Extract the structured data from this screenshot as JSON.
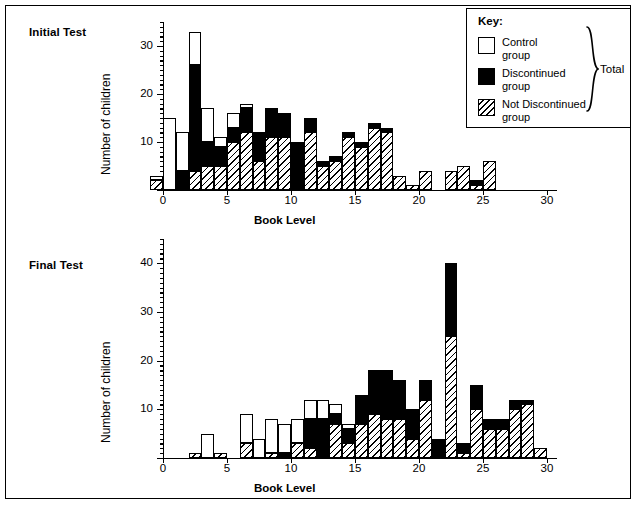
{
  "figure": {
    "background": "#ffffff",
    "frame_color": "#000000"
  },
  "legend": {
    "title": "Key:",
    "total_label": "Total",
    "entries": [
      {
        "name": "control-group",
        "label": "Control\ngroup",
        "swatch": "white-open-square",
        "color": "#ffffff"
      },
      {
        "name": "discontinued-group",
        "label": "Discontinued\ngroup",
        "swatch": "black-filled-square",
        "color": "#000000"
      },
      {
        "name": "not-discontinued-group",
        "label": "Not Discontinued\ngroup",
        "swatch": "hatched-square",
        "color": "#ffffff"
      }
    ]
  },
  "panels": [
    {
      "id": "initial",
      "title": "Initial Test"
    },
    {
      "id": "final",
      "title": "Final Test"
    }
  ],
  "chart_data": [
    {
      "type": "bar",
      "title": "Initial Test",
      "stacked": true,
      "xlabel": "Book Level",
      "ylabel": "Number of children",
      "xlim": [
        0,
        30
      ],
      "ylim": [
        0,
        35
      ],
      "xticks": [
        0,
        5,
        10,
        15,
        20,
        25,
        30
      ],
      "yticks": [
        0,
        10,
        20,
        30
      ],
      "grid": false,
      "legend_position": "top-right",
      "bin_width": 1,
      "bins": [
        -1,
        0,
        1,
        2,
        3,
        4,
        5,
        6,
        7,
        8,
        9,
        10,
        11,
        12,
        13,
        14,
        15,
        16,
        17,
        18,
        19,
        20,
        21,
        22,
        23,
        24,
        25,
        26
      ],
      "series": [
        {
          "name": "Not Discontinued group",
          "values": [
            1,
            15,
            8,
            7,
            7,
            2,
            3,
            1,
            0,
            0,
            0,
            0,
            0,
            0,
            0,
            0,
            0,
            0,
            0,
            0,
            0,
            0,
            0,
            0,
            0,
            0,
            0,
            0
          ]
        },
        {
          "name": "Discontinued group",
          "values": [
            0,
            0,
            4,
            22,
            5,
            4,
            3,
            5,
            6,
            6,
            5,
            10,
            3,
            1,
            1,
            1,
            1,
            1,
            1,
            0,
            0,
            0,
            0,
            0,
            0,
            1,
            0,
            0
          ]
        },
        {
          "name": "Control group",
          "values": [
            2,
            0,
            0,
            4,
            5,
            5,
            10,
            12,
            6,
            11,
            11,
            0,
            12,
            5,
            6,
            11,
            9,
            13,
            12,
            3,
            1,
            4,
            0,
            4,
            5,
            1,
            6,
            0
          ]
        }
      ],
      "totals": [
        3,
        15,
        12,
        33,
        17,
        11,
        16,
        18,
        12,
        17,
        16,
        10,
        15,
        6,
        7,
        12,
        10,
        14,
        13,
        3,
        1,
        4,
        0,
        4,
        5,
        2,
        6,
        0
      ]
    },
    {
      "type": "bar",
      "title": "Final Test",
      "stacked": true,
      "xlabel": "Book Level",
      "ylabel": "Number of children",
      "xlim": [
        0,
        30
      ],
      "ylim": [
        0,
        45
      ],
      "xticks": [
        0,
        5,
        10,
        15,
        20,
        25,
        30
      ],
      "yticks": [
        0,
        10,
        20,
        30,
        40
      ],
      "grid": false,
      "legend_position": "none",
      "bin_width": 1,
      "bins": [
        2,
        3,
        4,
        6,
        7,
        8,
        9,
        10,
        11,
        12,
        13,
        14,
        15,
        16,
        17,
        18,
        19,
        20,
        21,
        22,
        23,
        24,
        25,
        26,
        27,
        28,
        29
      ],
      "series": [
        {
          "name": "Not Discontinued group",
          "values": [
            0,
            5,
            0,
            6,
            4,
            7,
            6,
            5,
            4,
            4,
            2,
            1,
            0,
            0,
            0,
            0,
            0,
            0,
            0,
            0,
            0,
            0,
            0,
            0,
            0,
            0,
            0
          ]
        },
        {
          "name": "Discontinued group",
          "values": [
            0,
            0,
            0,
            0,
            0,
            0,
            1,
            0,
            6,
            8,
            2,
            3,
            6,
            9,
            10,
            8,
            6,
            4,
            4,
            15,
            2,
            5,
            2,
            2,
            2,
            1,
            0
          ]
        },
        {
          "name": "Control group",
          "values": [
            1,
            0,
            1,
            3,
            0,
            1,
            0,
            3,
            2,
            0,
            7,
            3,
            7,
            9,
            8,
            8,
            4,
            12,
            0,
            25,
            1,
            10,
            6,
            6,
            10,
            11,
            2
          ]
        }
      ],
      "totals": [
        1,
        5,
        1,
        9,
        4,
        8,
        7,
        8,
        12,
        12,
        11,
        7,
        13,
        18,
        18,
        16,
        10,
        16,
        4,
        40,
        3,
        15,
        8,
        8,
        12,
        12,
        2
      ]
    }
  ]
}
